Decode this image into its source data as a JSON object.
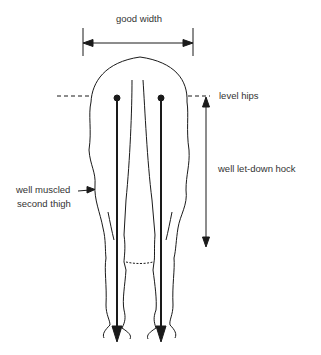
{
  "diagram": {
    "labels": {
      "good_width": "good width",
      "level_hips": "level hips",
      "well_let_down_hock": "well let-down hock",
      "well_muscled_line1": "well muscled",
      "well_muscled_line2": "second thigh"
    },
    "colors": {
      "line": "#1a1a1a",
      "text": "#333333",
      "background": "#ffffff"
    }
  }
}
